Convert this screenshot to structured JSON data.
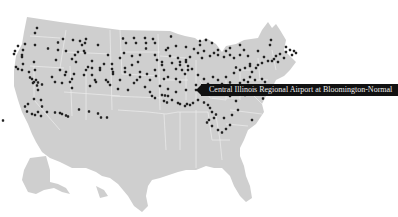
{
  "map": {
    "title": "US airports map",
    "land_color": "#cfcfcf",
    "border_color": "#eeeeee",
    "dot_color": "#222222"
  },
  "tooltip": {
    "text": "Central Illinois Regional Airport at Bloomington-Normal"
  },
  "airports": [
    [
      37,
      16
    ],
    [
      35,
      26
    ],
    [
      58,
      45
    ],
    [
      63,
      38
    ],
    [
      73,
      40
    ],
    [
      80,
      42
    ],
    [
      82,
      50
    ],
    [
      85,
      46
    ],
    [
      86,
      38
    ],
    [
      98,
      50
    ],
    [
      48,
      57
    ],
    [
      18,
      52
    ],
    [
      25,
      48
    ],
    [
      35,
      50
    ],
    [
      23,
      60
    ],
    [
      15,
      62
    ],
    [
      14,
      68
    ],
    [
      22,
      70
    ],
    [
      58,
      60
    ],
    [
      66,
      62
    ],
    [
      75,
      70
    ],
    [
      78,
      64
    ],
    [
      84,
      62
    ],
    [
      72,
      78
    ],
    [
      85,
      66
    ],
    [
      108,
      70
    ],
    [
      92,
      82
    ],
    [
      88,
      94
    ],
    [
      76,
      84
    ],
    [
      56,
      80
    ],
    [
      34,
      84
    ],
    [
      22,
      74
    ],
    [
      23,
      88
    ],
    [
      16,
      94
    ],
    [
      18,
      98
    ],
    [
      22,
      100
    ],
    [
      29,
      104
    ],
    [
      35,
      100
    ],
    [
      60,
      100
    ],
    [
      66,
      104
    ],
    [
      86,
      100
    ],
    [
      92,
      96
    ],
    [
      100,
      100
    ],
    [
      100,
      96
    ],
    [
      112,
      98
    ],
    [
      113,
      104
    ],
    [
      113,
      108
    ],
    [
      125,
      104
    ],
    [
      123,
      37
    ],
    [
      134,
      36
    ],
    [
      145,
      36
    ],
    [
      153,
      38
    ],
    [
      171,
      33
    ],
    [
      126,
      46
    ],
    [
      136,
      46
    ],
    [
      146,
      46
    ],
    [
      155,
      46
    ],
    [
      146,
      57
    ],
    [
      124,
      66
    ],
    [
      155,
      70
    ],
    [
      157,
      80
    ],
    [
      162,
      84
    ],
    [
      162,
      90
    ],
    [
      172,
      86
    ],
    [
      180,
      84
    ],
    [
      186,
      84
    ],
    [
      180,
      90
    ],
    [
      188,
      92
    ],
    [
      192,
      98
    ],
    [
      188,
      100
    ],
    [
      164,
      100
    ],
    [
      155,
      100
    ],
    [
      147,
      108
    ],
    [
      140,
      104
    ],
    [
      137,
      120
    ],
    [
      134,
      126
    ],
    [
      120,
      120
    ],
    [
      108,
      124
    ],
    [
      106,
      120
    ],
    [
      96,
      124
    ],
    [
      92,
      110
    ],
    [
      72,
      118
    ],
    [
      62,
      126
    ],
    [
      55,
      124
    ],
    [
      65,
      110
    ],
    [
      30,
      115
    ],
    [
      32,
      118
    ],
    [
      36,
      120
    ],
    [
      34,
      124
    ],
    [
      33,
      126
    ],
    [
      38,
      125
    ],
    [
      42,
      129
    ],
    [
      37,
      131
    ],
    [
      52,
      114
    ],
    [
      38,
      140
    ],
    [
      70,
      124
    ],
    [
      72,
      136
    ],
    [
      90,
      132
    ],
    [
      95,
      120
    ],
    [
      110,
      130
    ],
    [
      118,
      138
    ],
    [
      128,
      140
    ],
    [
      145,
      134
    ],
    [
      150,
      144
    ],
    [
      152,
      152
    ],
    [
      155,
      156
    ],
    [
      162,
      150
    ],
    [
      165,
      151
    ],
    [
      168,
      152
    ],
    [
      164,
      162
    ],
    [
      167,
      165
    ],
    [
      172,
      160
    ],
    [
      178,
      166
    ],
    [
      180,
      168
    ],
    [
      185,
      172
    ],
    [
      187,
      168
    ],
    [
      190,
      170
    ],
    [
      193,
      166
    ],
    [
      198,
      160
    ],
    [
      204,
      165
    ],
    [
      208,
      170
    ],
    [
      210,
      176
    ],
    [
      212,
      184
    ],
    [
      216,
      189
    ],
    [
      214,
      196
    ],
    [
      209,
      200
    ],
    [
      207,
      205
    ],
    [
      212,
      212
    ],
    [
      218,
      220
    ],
    [
      222,
      225
    ],
    [
      226,
      218
    ],
    [
      230,
      210
    ],
    [
      224,
      196
    ],
    [
      232,
      190
    ],
    [
      238,
      180
    ],
    [
      236,
      162
    ],
    [
      230,
      152
    ],
    [
      234,
      145
    ],
    [
      245,
      150
    ],
    [
      252,
      148
    ],
    [
      258,
      140
    ],
    [
      262,
      146
    ],
    [
      265,
      124
    ],
    [
      262,
      118
    ],
    [
      255,
      120
    ],
    [
      248,
      124
    ],
    [
      240,
      126
    ],
    [
      230,
      125
    ],
    [
      222,
      128
    ],
    [
      208,
      128
    ],
    [
      196,
      130
    ],
    [
      180,
      124
    ],
    [
      176,
      118
    ],
    [
      168,
      114
    ],
    [
      164,
      118
    ],
    [
      185,
      108
    ],
    [
      182,
      100
    ],
    [
      176,
      98
    ],
    [
      198,
      110
    ],
    [
      204,
      118
    ],
    [
      213,
      114
    ],
    [
      218,
      120
    ],
    [
      226,
      114
    ],
    [
      234,
      106
    ],
    [
      240,
      100
    ],
    [
      236,
      95
    ],
    [
      245,
      96
    ],
    [
      250,
      92
    ],
    [
      258,
      90
    ],
    [
      262,
      86
    ],
    [
      268,
      82
    ],
    [
      272,
      82
    ],
    [
      264,
      74
    ],
    [
      258,
      62
    ],
    [
      270,
      50
    ],
    [
      271,
      40
    ],
    [
      286,
      54
    ],
    [
      286,
      64
    ],
    [
      280,
      68
    ],
    [
      276,
      72
    ],
    [
      274,
      78
    ],
    [
      278,
      84
    ],
    [
      290,
      60
    ],
    [
      294,
      62
    ],
    [
      296,
      66
    ],
    [
      292,
      70
    ],
    [
      284,
      76
    ],
    [
      248,
      72
    ],
    [
      240,
      70
    ],
    [
      244,
      60
    ],
    [
      240,
      50
    ],
    [
      230,
      56
    ],
    [
      226,
      62
    ],
    [
      218,
      60
    ],
    [
      214,
      66
    ],
    [
      210,
      72
    ],
    [
      202,
      76
    ],
    [
      190,
      74
    ],
    [
      186,
      80
    ],
    [
      178,
      76
    ],
    [
      170,
      72
    ],
    [
      166,
      60
    ],
    [
      168,
      56
    ],
    [
      176,
      52
    ],
    [
      186,
      54
    ],
    [
      194,
      58
    ],
    [
      198,
      66
    ],
    [
      204,
      62
    ],
    [
      200,
      50
    ],
    [
      212,
      46
    ],
    [
      206,
      40
    ],
    [
      200,
      42
    ],
    [
      218,
      70
    ],
    [
      224,
      74
    ],
    [
      230,
      70
    ],
    [
      234,
      76
    ],
    [
      250,
      88
    ],
    [
      256,
      96
    ],
    [
      252,
      104
    ],
    [
      250,
      114
    ],
    [
      244,
      120
    ],
    [
      232,
      134
    ],
    [
      242,
      134
    ],
    [
      248,
      138
    ],
    [
      196,
      140
    ],
    [
      186,
      140
    ],
    [
      176,
      144
    ],
    [
      168,
      138
    ],
    [
      160,
      132
    ],
    [
      150,
      120
    ],
    [
      156,
      112
    ],
    [
      140,
      114
    ],
    [
      130,
      110
    ],
    [
      125,
      96
    ],
    [
      132,
      90
    ],
    [
      138,
      84
    ],
    [
      140,
      70
    ],
    [
      132,
      72
    ],
    [
      120,
      76
    ],
    [
      112,
      88
    ],
    [
      104,
      88
    ],
    [
      84,
      110
    ],
    [
      74,
      108
    ],
    [
      34,
      158
    ],
    [
      41,
      160
    ],
    [
      28,
      168
    ],
    [
      25,
      173
    ],
    [
      42,
      173
    ],
    [
      27,
      183
    ],
    [
      32,
      188
    ],
    [
      35,
      190
    ],
    [
      41,
      192
    ],
    [
      38,
      184
    ],
    [
      47,
      184
    ],
    [
      55,
      185
    ],
    [
      60,
      186
    ],
    [
      62,
      188
    ],
    [
      66,
      191
    ],
    [
      68,
      193
    ],
    [
      79,
      179
    ],
    [
      89,
      183
    ],
    [
      98,
      187
    ],
    [
      101,
      195
    ],
    [
      107,
      195
    ],
    [
      3,
      201
    ],
    [
      252,
      200
    ],
    [
      263,
      157
    ]
  ]
}
